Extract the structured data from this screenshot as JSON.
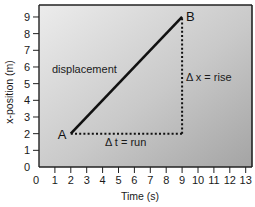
{
  "chart_data": {
    "type": "line",
    "title": "",
    "xlabel": "Time (s)",
    "ylabel": "x-position (m)",
    "xlim": [
      0,
      13
    ],
    "ylim": [
      0,
      9
    ],
    "xticks": [
      "0",
      "1",
      "2",
      "3",
      "4",
      "5",
      "6",
      "7",
      "8",
      "9",
      "10",
      "11",
      "12",
      "13"
    ],
    "yticks": [
      "0",
      "1",
      "2",
      "3",
      "4",
      "5",
      "6",
      "7",
      "8",
      "9"
    ],
    "grid": false,
    "series": [
      {
        "name": "displacement",
        "x": [
          2,
          9
        ],
        "y": [
          2,
          9
        ],
        "style": "solid"
      }
    ],
    "guides": [
      {
        "name": "Δt = run",
        "x": [
          2,
          9
        ],
        "y": [
          2,
          2
        ],
        "style": "dotted"
      },
      {
        "name": "Δx = rise",
        "x": [
          9,
          9
        ],
        "y": [
          2,
          9
        ],
        "style": "dotted"
      }
    ],
    "points": [
      {
        "label": "A",
        "x": 2,
        "y": 2
      },
      {
        "label": "B",
        "x": 9,
        "y": 9
      }
    ],
    "annotations": {
      "line_label": "displacement",
      "rise_label": "Δ x = rise",
      "run_label": "Δ t = run"
    },
    "colors": {
      "plot_bg_light": "#e8e8e8",
      "plot_bg_dark": "#a9a9a9",
      "line": "#111111"
    }
  }
}
